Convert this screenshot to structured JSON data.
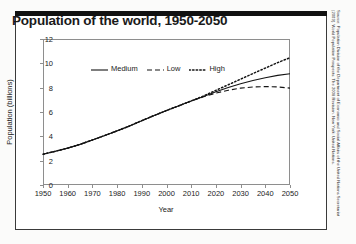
{
  "figure": {
    "title": "Population of the world, 1950-2050",
    "source": "Source: Population Division of the Department of Economic and Social Affairs of the United Nations Secretariat (2009). World Population Prospects: The 2008 Revision. New York: United Nations."
  },
  "legend": {
    "position": "top-left-inside",
    "items": [
      {
        "label": "Medium",
        "style": "solid",
        "key": "medium-line-key"
      },
      {
        "label": "Low",
        "style": "dashed",
        "key": "low-line-key"
      },
      {
        "label": "High",
        "style": "dotted",
        "key": "high-line-key"
      }
    ]
  },
  "chart_data": {
    "type": "line",
    "title": "Population of the world, 1950-2050",
    "xlabel": "Year",
    "ylabel": "Population (billions)",
    "xlim": [
      1950,
      2050
    ],
    "ylim": [
      0,
      12
    ],
    "xticks": [
      1950,
      1960,
      1970,
      1980,
      1990,
      2000,
      2010,
      2020,
      2030,
      2040,
      2050
    ],
    "yticks": [
      0,
      2,
      4,
      6,
      8,
      10,
      12
    ],
    "grid": false,
    "x": [
      1950,
      1955,
      1960,
      1965,
      1970,
      1975,
      1980,
      1985,
      1990,
      1995,
      2000,
      2005,
      2010,
      2015,
      2020,
      2025,
      2030,
      2035,
      2040,
      2045,
      2050
    ],
    "series": [
      {
        "name": "Medium",
        "style": "solid",
        "values": [
          2.53,
          2.77,
          3.03,
          3.34,
          3.7,
          4.07,
          4.45,
          4.85,
          5.29,
          5.71,
          6.12,
          6.51,
          6.91,
          7.28,
          7.66,
          8.01,
          8.32,
          8.59,
          8.82,
          9.01,
          9.15
        ]
      },
      {
        "name": "Low",
        "style": "dashed",
        "values": [
          2.53,
          2.77,
          3.03,
          3.34,
          3.7,
          4.07,
          4.45,
          4.85,
          5.29,
          5.71,
          6.12,
          6.51,
          6.91,
          7.25,
          7.55,
          7.79,
          7.96,
          8.06,
          8.09,
          8.06,
          7.96
        ]
      },
      {
        "name": "High",
        "style": "dotted",
        "values": [
          2.53,
          2.77,
          3.03,
          3.34,
          3.7,
          4.07,
          4.45,
          4.85,
          5.29,
          5.71,
          6.12,
          6.51,
          6.91,
          7.32,
          7.78,
          8.24,
          8.7,
          9.16,
          9.61,
          10.06,
          10.46
        ]
      }
    ]
  }
}
